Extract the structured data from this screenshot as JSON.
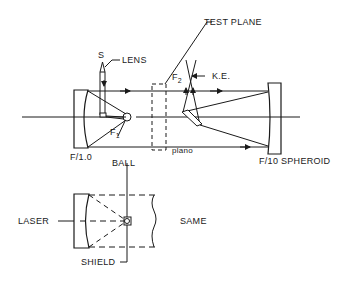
{
  "diagram": {
    "labels": {
      "source": "S",
      "lens": "LENS",
      "test_plane": "TEST PLANE",
      "focus2": "F",
      "focus2_sub": "2",
      "knife_edge": "K.E.",
      "focus1": "F",
      "focus1_sub": "1",
      "primary_mirror": "F/1.0",
      "ball": "BALL",
      "plano": "plano",
      "spheroid": "F/10 SPHEROID",
      "laser": "LASER",
      "same": "SAME",
      "shield": "SHIELD"
    },
    "colors": {
      "line": "#1a1a1a",
      "background": "#ffffff"
    }
  }
}
